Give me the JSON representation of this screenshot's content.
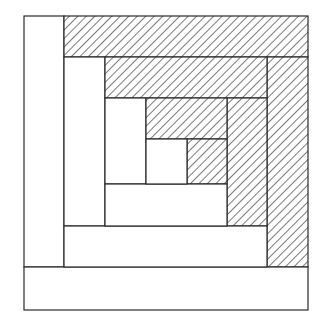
{
  "diagram": {
    "stroke_color": "#2a2a2a",
    "fill_plain": "#ffffff",
    "hatch_color": "#333333",
    "pieces": [
      {
        "id": "border-left",
        "x": 24,
        "y": 16,
        "w": 40,
        "h": 251,
        "hatched": false
      },
      {
        "id": "border-top",
        "x": 64,
        "y": 16,
        "w": 244,
        "h": 41,
        "hatched": true
      },
      {
        "id": "border-right",
        "x": 267,
        "y": 57,
        "w": 41,
        "h": 210,
        "hatched": true
      },
      {
        "id": "border-bottom",
        "x": 24,
        "y": 267,
        "w": 284,
        "h": 43,
        "hatched": false
      },
      {
        "id": "ring2-left",
        "x": 64,
        "y": 57,
        "w": 41,
        "h": 169,
        "hatched": false
      },
      {
        "id": "ring2-top",
        "x": 105,
        "y": 57,
        "w": 162,
        "h": 41,
        "hatched": true
      },
      {
        "id": "ring2-right",
        "x": 227,
        "y": 98,
        "w": 40,
        "h": 128,
        "hatched": true
      },
      {
        "id": "ring2-bottom",
        "x": 64,
        "y": 226,
        "w": 203,
        "h": 41,
        "hatched": false
      },
      {
        "id": "ring3-left",
        "x": 105,
        "y": 98,
        "w": 41,
        "h": 86,
        "hatched": false
      },
      {
        "id": "ring3-top",
        "x": 146,
        "y": 98,
        "w": 81,
        "h": 41,
        "hatched": true
      },
      {
        "id": "ring3-right",
        "x": 187,
        "y": 139,
        "w": 40,
        "h": 45,
        "hatched": true
      },
      {
        "id": "ring3-bottom",
        "x": 105,
        "y": 184,
        "w": 122,
        "h": 42,
        "hatched": false
      },
      {
        "id": "center",
        "x": 146,
        "y": 139,
        "w": 41,
        "h": 45,
        "hatched": false
      }
    ]
  }
}
